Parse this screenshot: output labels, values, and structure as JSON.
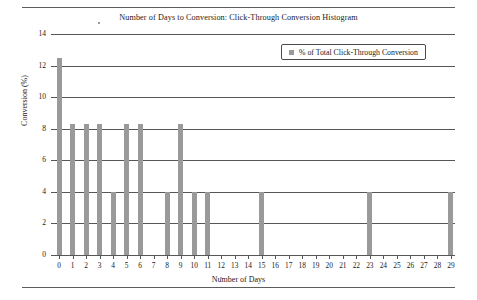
{
  "figure": {
    "title": "Number of Days to Conversion: Click-Through Conversion Histogram",
    "legend_label": "% of Total Click-Through Conversion",
    "bar_color": "#9a9a9a",
    "axis_color": "#54565a"
  },
  "chart_data": {
    "type": "bar",
    "title": "Number of Days to Conversion: Click-Through Conversion Histogram",
    "xlabel": "Number of Days",
    "ylabel": "Conversion (%)",
    "categories": [
      0,
      1,
      2,
      3,
      4,
      5,
      6,
      7,
      8,
      9,
      10,
      11,
      12,
      13,
      14,
      15,
      16,
      17,
      18,
      19,
      20,
      21,
      22,
      23,
      24,
      25,
      26,
      27,
      28,
      29
    ],
    "values": [
      12.5,
      8.3,
      8.3,
      8.3,
      4.0,
      8.3,
      8.3,
      0,
      4.0,
      8.3,
      4.0,
      4.0,
      0,
      0,
      0,
      4.0,
      0,
      0,
      0,
      0,
      0,
      0,
      0,
      4.0,
      0,
      0,
      0,
      0,
      0,
      4.0
    ],
    "series": [
      {
        "name": "% of Total Click-Through Conversion",
        "values": [
          12.5,
          8.3,
          8.3,
          8.3,
          4.0,
          8.3,
          8.3,
          0,
          4.0,
          8.3,
          4.0,
          4.0,
          0,
          0,
          0,
          4.0,
          0,
          0,
          0,
          0,
          0,
          0,
          0,
          4.0,
          0,
          0,
          0,
          0,
          0,
          4.0
        ]
      }
    ],
    "xtick_labels": [
      "0",
      "1",
      "2",
      "3",
      "4",
      "5",
      "6",
      "7",
      "8",
      "9",
      "10",
      "11",
      "12",
      "13",
      "14",
      "15",
      "16",
      "17",
      "18",
      "19",
      "20",
      "21",
      "22",
      "23",
      "24",
      "25",
      "26",
      "27",
      "28",
      "29"
    ],
    "ytick_labels": [
      "0",
      "2",
      "4",
      "6",
      "8",
      "10",
      "12",
      "14"
    ],
    "ytick_values": [
      0,
      2,
      4,
      6,
      8,
      10,
      12,
      14
    ],
    "ylim": [
      0,
      14
    ],
    "xlim": [
      0,
      29
    ],
    "grid": "horizontal",
    "legend": [
      "% of Total Click-Through Conversion"
    ],
    "legend_position": "top-right"
  }
}
